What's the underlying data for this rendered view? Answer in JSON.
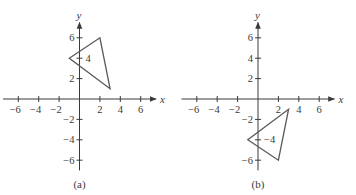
{
  "figure": {
    "panels": [
      {
        "id": "a",
        "caption": "(a)",
        "origin_px": [
          79.5,
          99
        ],
        "unit_px": 10.2,
        "x_axis_label": "x",
        "y_axis_label": "y",
        "x_ticks": [
          -6,
          -4,
          -2,
          2,
          4,
          6
        ],
        "y_ticks": [
          6,
          4,
          2,
          -2,
          -4,
          -6
        ],
        "x_range": [
          -7.5,
          7.5
        ],
        "y_range": [
          -7,
          7.5
        ],
        "triangle": [
          [
            -1,
            4
          ],
          [
            2,
            6
          ],
          [
            3,
            1
          ]
        ],
        "inside_label_tick": 4
      },
      {
        "id": "b",
        "caption": "(b)",
        "origin_px": [
          258,
          99
        ],
        "unit_px": 10.2,
        "x_axis_label": "x",
        "y_axis_label": "y",
        "x_ticks": [
          -6,
          -4,
          -2,
          2,
          4,
          6
        ],
        "y_ticks": [
          6,
          4,
          2,
          -2,
          -4,
          -6
        ],
        "x_range": [
          -7.5,
          7.5
        ],
        "y_range": [
          -7,
          7.5
        ],
        "triangle": [
          [
            -1,
            -4
          ],
          [
            2,
            -6
          ],
          [
            3,
            -1
          ]
        ],
        "inside_label_tick": -4
      }
    ],
    "colors": {
      "axis": "#3a3a3a",
      "triangle": "#5a5a5a",
      "text": "#3a3a3a"
    }
  },
  "chart_data": [
    {
      "type": "scatter",
      "title": "(a)",
      "xlabel": "x",
      "ylabel": "y",
      "xlim": [
        -7,
        7
      ],
      "ylim": [
        -7,
        7
      ],
      "x_tick_labels": [
        "-6",
        "-4",
        "-2",
        "2",
        "4",
        "6"
      ],
      "y_tick_labels": [
        "6",
        "4",
        "2",
        "-2",
        "-4",
        "-6"
      ],
      "grid": false,
      "series": [
        {
          "name": "triangle",
          "shape": "polygon",
          "points": [
            [
              -1,
              4
            ],
            [
              2,
              6
            ],
            [
              3,
              1
            ]
          ]
        }
      ]
    },
    {
      "type": "scatter",
      "title": "(b)",
      "xlabel": "x",
      "ylabel": "y",
      "xlim": [
        -7,
        7
      ],
      "ylim": [
        -7,
        7
      ],
      "x_tick_labels": [
        "-6",
        "-4",
        "-2",
        "2",
        "4",
        "6"
      ],
      "y_tick_labels": [
        "6",
        "4",
        "2",
        "-2",
        "-4",
        "-6"
      ],
      "grid": false,
      "series": [
        {
          "name": "triangle (reflected across x-axis)",
          "shape": "polygon",
          "points": [
            [
              -1,
              -4
            ],
            [
              2,
              -6
            ],
            [
              3,
              -1
            ]
          ]
        }
      ]
    }
  ]
}
